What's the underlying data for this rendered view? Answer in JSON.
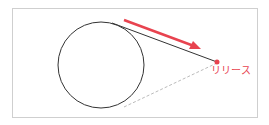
{
  "diagram": {
    "label": "リリース",
    "colors": {
      "accent": "#e8434f",
      "line": "#333333",
      "dashed": "#aaaaaa",
      "frame": "#cfcfcf"
    },
    "elements": [
      "circle",
      "tangent-line",
      "dashed-tangent-line",
      "release-arrow",
      "release-point",
      "release-label"
    ]
  }
}
